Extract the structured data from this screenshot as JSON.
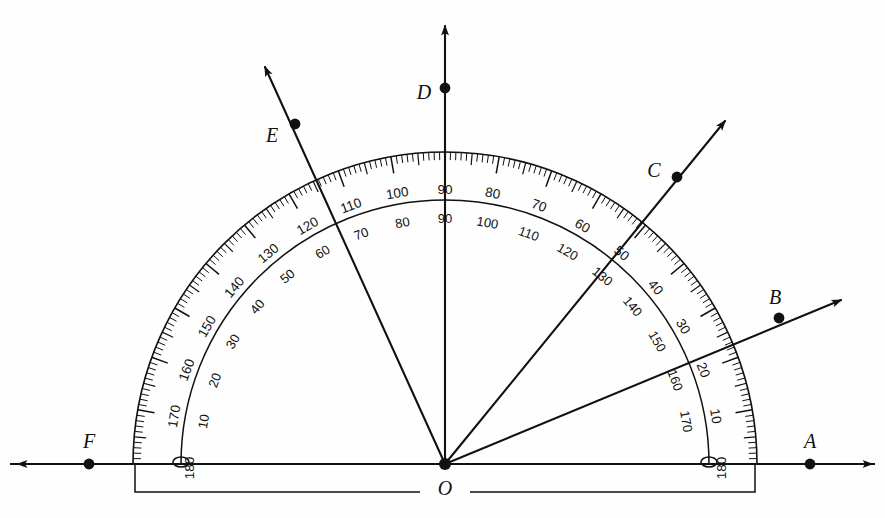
{
  "figure": {
    "type": "protractor-diagram",
    "title": "",
    "center_label": "O"
  },
  "geometry": {
    "center": {
      "x": 445,
      "y": 464
    },
    "outer_radius": 312,
    "inner_radius": 264,
    "tick_band_inner": 282,
    "baseline": {
      "x1": 10,
      "y1": 464,
      "x2": 875,
      "y2": 464
    },
    "bracket": {
      "x1": 135,
      "x2": 755,
      "y_top": 464,
      "y_bottom": 492
    },
    "gap_left": 420,
    "gap_right": 470
  },
  "points": [
    {
      "name": "A",
      "label": "A",
      "angle_deg": 0,
      "dot": {
        "x": 810,
        "y": 464
      },
      "label_pos": {
        "x": 810,
        "y": 443
      },
      "ray_end": {
        "x": 872,
        "y": 464
      },
      "on_baseline": true
    },
    {
      "name": "B",
      "label": "B",
      "angle_deg": 20,
      "dot": {
        "x": 779,
        "y": 318
      },
      "label_pos": {
        "x": 775,
        "y": 299
      },
      "ray_end": {
        "x": 841,
        "y": 300
      },
      "on_baseline": false
    },
    {
      "name": "C",
      "label": "C",
      "angle_deg": 50,
      "dot": {
        "x": 677,
        "y": 177
      },
      "label_pos": {
        "x": 654,
        "y": 172
      },
      "ray_end": {
        "x": 725,
        "y": 121
      },
      "on_baseline": false
    },
    {
      "name": "D",
      "label": "D",
      "angle_deg": 90,
      "dot": {
        "x": 445,
        "y": 88
      },
      "label_pos": {
        "x": 424,
        "y": 94
      },
      "ray_end": {
        "x": 445,
        "y": 26
      },
      "on_baseline": false
    },
    {
      "name": "E",
      "label": "E",
      "angle_deg": 115,
      "dot": {
        "x": 295,
        "y": 124
      },
      "label_pos": {
        "x": 272,
        "y": 137
      },
      "ray_end": {
        "x": 265,
        "y": 67
      },
      "on_baseline": false
    },
    {
      "name": "F",
      "label": "F",
      "angle_deg": 180,
      "dot": {
        "x": 89,
        "y": 464
      },
      "label_pos": {
        "x": 89,
        "y": 443
      },
      "ray_end": {
        "x": 18,
        "y": 464
      },
      "on_baseline": true
    }
  ],
  "scales": {
    "outer_scale_name": "outer",
    "inner_scale_name": "inner",
    "outer_values": [
      0,
      10,
      20,
      30,
      40,
      50,
      60,
      70,
      80,
      90,
      100,
      110,
      120,
      130,
      140,
      150,
      160,
      170,
      180
    ],
    "inner_values": [
      180,
      170,
      160,
      150,
      140,
      130,
      120,
      110,
      100,
      90,
      80,
      70,
      60,
      50,
      40,
      30,
      20,
      10,
      0
    ],
    "outer_zero_side": "right",
    "inner_zero_side": "left",
    "tick_step_deg": 1,
    "major_every_deg": 10,
    "mid_every_deg": 5,
    "endpoint_labels": {
      "left_outer": "180",
      "left_inner": "0",
      "right_outer": "180",
      "right_inner": "0"
    }
  },
  "ticks": {
    "major_len": 17,
    "mid_len": 12,
    "minor_len": 8
  },
  "colors": {
    "ink": "#111111",
    "paper": "#fefefe"
  }
}
